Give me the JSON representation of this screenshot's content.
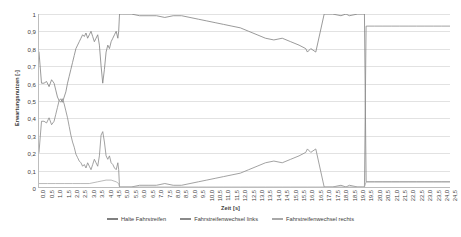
{
  "chart_data": {
    "type": "line",
    "title": "",
    "xlabel": "Zeit [s]",
    "ylabel": "Erwartungsnutzen [-]",
    "xlim": [
      0,
      24.5
    ],
    "ylim": [
      0,
      1
    ],
    "grid": true,
    "legend_position": "bottom",
    "y_ticks": [
      "1",
      "0,9",
      "0,8",
      "0,7",
      "0,6",
      "0,5",
      "0,4",
      "0,3",
      "0,2",
      "0,1",
      "0"
    ],
    "y_tick_values": [
      1,
      0.9,
      0.8,
      0.7,
      0.6,
      0.5,
      0.4,
      0.3,
      0.2,
      0.1,
      0
    ],
    "x_ticks": [
      "0,0",
      "0,5",
      "1,0",
      "1,5",
      "2,0",
      "2,5",
      "3,0",
      "3,5",
      "4,0",
      "4,5",
      "5,0",
      "5,5",
      "6,0",
      "6,5",
      "7,0",
      "7,5",
      "8,0",
      "8,5",
      "9,0",
      "9,5",
      "10,0",
      "10,5",
      "11,0",
      "11,5",
      "12,0",
      "12,5",
      "13,0",
      "13,5",
      "14,0",
      "14,5",
      "15,0",
      "15,5",
      "16,0",
      "16,5",
      "17,0",
      "17,5",
      "18,0",
      "18,5",
      "19,0",
      "19,5",
      "20,0",
      "20,5",
      "21,0",
      "21,5",
      "22,0",
      "22,5",
      "23,0",
      "23,5",
      "24,0",
      "24,5"
    ],
    "x_tick_values": [
      0,
      0.5,
      1,
      1.5,
      2,
      2.5,
      3,
      3.5,
      4,
      4.5,
      5,
      5.5,
      6,
      6.5,
      7,
      7.5,
      8,
      8.5,
      9,
      9.5,
      10,
      10.5,
      11,
      11.5,
      12,
      12.5,
      13,
      13.5,
      14,
      14.5,
      15,
      15.5,
      16,
      16.5,
      17,
      17.5,
      18,
      18.5,
      19,
      19.5,
      20,
      20.5,
      21,
      21.5,
      22,
      22.5,
      23,
      23.5,
      24,
      24.5
    ],
    "series": [
      {
        "name": "Halte Fahrstreifen",
        "color": "#808080",
        "x": [
          0.0,
          0.15,
          0.3,
          0.45,
          0.6,
          0.75,
          0.9,
          1.0,
          1.1,
          1.2,
          1.3,
          1.4,
          1.5,
          1.6,
          1.7,
          1.8,
          1.9,
          2.0,
          2.1,
          2.2,
          2.3,
          2.4,
          2.5,
          2.6,
          2.7,
          2.8,
          2.9,
          3.0,
          3.1,
          3.2,
          3.3,
          3.4,
          3.5,
          3.6,
          3.7,
          3.8,
          3.9,
          4.0,
          4.1,
          4.2,
          4.3,
          4.4,
          4.5,
          4.6,
          4.7,
          4.75,
          4.8,
          4.9,
          5.0,
          5.5,
          6.0,
          6.5,
          7.0,
          7.5,
          8.0,
          8.5,
          9.0,
          9.5,
          10.0,
          10.5,
          11.0,
          11.5,
          12.0,
          12.5,
          13.0,
          13.5,
          14.0,
          14.5,
          15.0,
          15.5,
          15.9,
          16.0,
          16.2,
          16.5,
          17.0,
          17.5,
          18.0,
          18.3,
          18.5,
          19.0,
          19.3,
          19.4,
          19.5,
          20.0,
          20.5,
          21.0,
          21.5,
          22.0,
          22.5,
          23.0,
          23.5,
          24.0,
          24.5
        ],
        "y": [
          0.78,
          0.6,
          0.6,
          0.61,
          0.58,
          0.62,
          0.6,
          0.56,
          0.52,
          0.5,
          0.51,
          0.49,
          0.52,
          0.55,
          0.6,
          0.64,
          0.68,
          0.72,
          0.76,
          0.8,
          0.82,
          0.84,
          0.86,
          0.88,
          0.87,
          0.89,
          0.86,
          0.88,
          0.9,
          0.87,
          0.84,
          0.86,
          0.88,
          0.82,
          0.7,
          0.6,
          0.68,
          0.78,
          0.82,
          0.8,
          0.84,
          0.86,
          0.88,
          0.9,
          0.86,
          0.9,
          1.0,
          1.0,
          1.0,
          1.0,
          0.99,
          0.99,
          0.99,
          0.98,
          0.99,
          0.99,
          0.98,
          0.97,
          0.96,
          0.95,
          0.94,
          0.93,
          0.92,
          0.9,
          0.88,
          0.86,
          0.85,
          0.86,
          0.84,
          0.82,
          0.8,
          0.78,
          0.8,
          0.78,
          1.0,
          1.0,
          0.99,
          1.0,
          0.99,
          1.0,
          1.0,
          1.0,
          0.03,
          0.03,
          0.03,
          0.03,
          0.03,
          0.03,
          0.03,
          0.03,
          0.03,
          0.03,
          0.03
        ]
      },
      {
        "name": "Fahrstreifenwechsel links",
        "color": "#8a8a8a",
        "x": [
          0.0,
          0.15,
          0.3,
          0.45,
          0.6,
          0.75,
          0.9,
          1.0,
          1.1,
          1.2,
          1.3,
          1.4,
          1.5,
          1.6,
          1.7,
          1.8,
          1.9,
          2.0,
          2.1,
          2.2,
          2.3,
          2.4,
          2.5,
          2.6,
          2.7,
          2.8,
          2.9,
          3.0,
          3.1,
          3.2,
          3.3,
          3.4,
          3.5,
          3.6,
          3.7,
          3.8,
          3.9,
          4.0,
          4.1,
          4.2,
          4.3,
          4.4,
          4.5,
          4.6,
          4.7,
          4.75,
          4.8,
          4.9,
          5.0,
          5.5,
          6.0,
          6.5,
          7.0,
          7.5,
          8.0,
          8.5,
          9.0,
          9.5,
          10.0,
          10.5,
          11.0,
          11.5,
          12.0,
          12.5,
          13.0,
          13.5,
          14.0,
          14.5,
          15.0,
          15.5,
          15.9,
          16.0,
          16.2,
          16.5,
          17.0,
          17.5,
          18.0,
          18.3,
          18.5,
          19.0,
          19.3,
          19.4,
          19.5,
          20.0,
          20.5,
          21.0,
          21.5,
          22.0,
          22.5,
          23.0,
          23.5,
          24.0,
          24.5
        ],
        "y": [
          0.2,
          0.38,
          0.38,
          0.37,
          0.4,
          0.36,
          0.38,
          0.42,
          0.46,
          0.5,
          0.49,
          0.51,
          0.48,
          0.44,
          0.4,
          0.35,
          0.3,
          0.26,
          0.23,
          0.19,
          0.17,
          0.15,
          0.14,
          0.12,
          0.13,
          0.11,
          0.14,
          0.12,
          0.1,
          0.13,
          0.16,
          0.14,
          0.12,
          0.18,
          0.3,
          0.32,
          0.26,
          0.18,
          0.16,
          0.18,
          0.14,
          0.13,
          0.11,
          0.1,
          0.14,
          0.1,
          0.0,
          0.0,
          0.0,
          0.0,
          0.01,
          0.01,
          0.01,
          0.02,
          0.01,
          0.01,
          0.02,
          0.03,
          0.04,
          0.05,
          0.06,
          0.07,
          0.08,
          0.1,
          0.12,
          0.14,
          0.15,
          0.14,
          0.16,
          0.18,
          0.2,
          0.22,
          0.2,
          0.22,
          0.0,
          0.0,
          0.01,
          0.0,
          0.01,
          0.0,
          0.0,
          0.0,
          0.93,
          0.93,
          0.93,
          0.93,
          0.93,
          0.93,
          0.93,
          0.93,
          0.93,
          0.93,
          0.93
        ]
      },
      {
        "name": "Fahrstreifenwechsel rechts",
        "color": "#a8a8a8",
        "x": [
          0.0,
          0.5,
          1.0,
          1.5,
          2.0,
          2.5,
          3.0,
          3.5,
          4.0,
          4.3,
          4.6,
          4.75,
          4.8,
          5.0,
          5.5,
          6.0,
          6.5,
          7.0,
          7.5,
          8.0,
          8.5,
          9.0,
          9.5,
          10.0,
          10.5,
          11.0,
          11.5,
          12.0,
          12.5,
          13.0,
          13.5,
          14.0,
          14.5,
          15.0,
          15.5,
          16.0,
          16.5,
          17.0,
          17.5,
          18.0,
          18.5,
          19.0,
          19.3,
          19.4,
          19.5,
          20.0,
          21.0,
          22.0,
          23.0,
          24.0,
          24.5
        ],
        "y": [
          0.02,
          0.02,
          0.02,
          0.02,
          0.02,
          0.02,
          0.02,
          0.03,
          0.04,
          0.04,
          0.03,
          0.02,
          0.0,
          0.0,
          0.0,
          0.0,
          0.0,
          0.0,
          0.0,
          0.0,
          0.0,
          0.0,
          0.0,
          0.0,
          0.0,
          0.0,
          0.0,
          0.0,
          0.0,
          0.0,
          0.0,
          0.0,
          0.0,
          0.0,
          0.0,
          0.0,
          0.0,
          0.0,
          0.0,
          0.0,
          0.0,
          0.0,
          0.0,
          0.0,
          0.03,
          0.03,
          0.03,
          0.03,
          0.03,
          0.03,
          0.03
        ]
      }
    ]
  },
  "legend": {
    "items": [
      {
        "label": "Halte Fahrstreifen",
        "color": "#808080"
      },
      {
        "label": "Fahrstreifenwechsel links",
        "color": "#8a8a8a"
      },
      {
        "label": "Fahrstreifenwechsel rechts",
        "color": "#a8a8a8"
      }
    ]
  },
  "axis_titles": {
    "x": "Zeit [s]",
    "y": "Erwartungsnutzen [-]"
  }
}
